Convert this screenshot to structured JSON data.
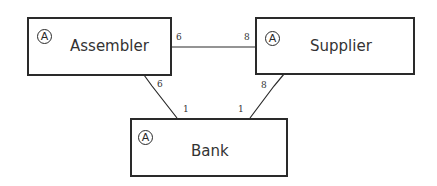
{
  "diagram": {
    "type": "entity-association",
    "nodes": [
      {
        "id": "assembler",
        "label": "Assembler",
        "badge": "A"
      },
      {
        "id": "supplier",
        "label": "Supplier",
        "badge": "A"
      },
      {
        "id": "bank",
        "label": "Bank",
        "badge": "A"
      }
    ],
    "edges": [
      {
        "from": "assembler",
        "to": "supplier",
        "from_mult": "6",
        "to_mult": "8"
      },
      {
        "from": "assembler",
        "to": "bank",
        "from_mult": "6",
        "to_mult": "1"
      },
      {
        "from": "supplier",
        "to": "bank",
        "from_mult": "8",
        "to_mult": "1"
      }
    ],
    "colors": {
      "stroke": "#2a2a2a",
      "text": "#333333",
      "background": "#ffffff"
    }
  }
}
